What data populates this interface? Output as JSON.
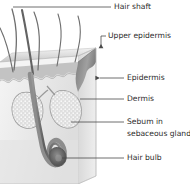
{
  "figure": {
    "labels": [
      {
        "id": "hair-shaft",
        "text": "Hair shaft",
        "x": 114,
        "y": 9
      },
      {
        "id": "upper-epidermis",
        "text": "Upper epidermis",
        "x": 108,
        "y": 38
      },
      {
        "id": "epidermis",
        "text": "Epidermis",
        "x": 127,
        "y": 80
      },
      {
        "id": "dermis",
        "text": "Dermis",
        "x": 127,
        "y": 101
      },
      {
        "id": "sebum-in",
        "text": "Sebum in",
        "x": 127,
        "y": 124
      },
      {
        "id": "sebaceous-gland",
        "text": "sebaceous gland",
        "x": 127,
        "y": 136
      },
      {
        "id": "hair-bulb",
        "text": "Hair bulb",
        "x": 127,
        "y": 160
      }
    ],
    "colors": {
      "label_text": "#2b2b2b",
      "leader_line": "#4a4a4a",
      "hair_stroke": "#6f6f6f",
      "epidermis_band": "#b9b9b9",
      "dermis_fill": "#ebebeb",
      "side_face": "#d4d4d4",
      "cut_wedge": "#8e8e8e",
      "gland_outline": "#9a9a9a",
      "gland_fill": "#e2e2e2",
      "follicle_dark": "#6a6a6a",
      "background": "#ffffff"
    }
  }
}
